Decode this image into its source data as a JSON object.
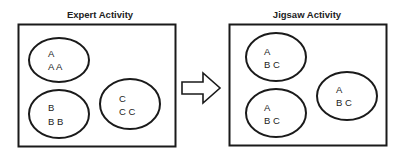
{
  "diagram": {
    "panels": [
      {
        "title": "Expert Activity",
        "groups": [
          {
            "line1": "A",
            "line2": "A A"
          },
          {
            "line1": "B",
            "line2": "B B"
          },
          {
            "line1": "C",
            "line2": "C C"
          }
        ]
      },
      {
        "title": "Jigsaw Activity",
        "groups": [
          {
            "line1": "A",
            "line2": "B C"
          },
          {
            "line1": "A",
            "line2": "B C"
          },
          {
            "line1": "A",
            "line2": "B C"
          }
        ]
      }
    ],
    "arrow": "right-arrow",
    "colors": {
      "stroke": "#1a1a1a",
      "background": "#ffffff"
    }
  }
}
